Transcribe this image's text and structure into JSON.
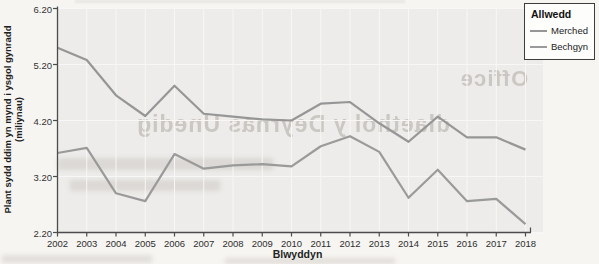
{
  "colors": {
    "page_bg": "#f6f5f2",
    "plot_bg": "#edecea",
    "gridline": "#f8f7f5",
    "axis": "#4c4c4c",
    "line_gray": "#969696",
    "legend_border": "#3d3d3d"
  },
  "chart": {
    "y_axis_label_line1": "Plant sydd ddim yn mynd i ysgol gynradd",
    "y_axis_label_line2": "(miliynau)",
    "x_axis_label": "Blwyddyn",
    "legend_title": "Allwedd"
  },
  "chart_data": {
    "type": "line",
    "title": "",
    "xlabel": "Blwyddyn",
    "ylabel": "Plant sydd ddim yn mynd i ysgol gynradd (miliynau)",
    "ylim": [
      2.2,
      6.2
    ],
    "yticks": [
      "6.20",
      "5.20",
      "4.20",
      "3.20",
      "2.20"
    ],
    "grid": true,
    "legend_position": "top-right",
    "categories": [
      "2002",
      "2003",
      "2004",
      "2005",
      "2006",
      "2007",
      "2008",
      "2009",
      "2010",
      "2011",
      "2012",
      "2013",
      "2014",
      "2015",
      "2016",
      "2017",
      "2018"
    ],
    "series": [
      {
        "name": "Merched",
        "color": "#969696",
        "values": [
          5.5,
          5.28,
          4.65,
          4.28,
          4.82,
          4.32,
          4.27,
          4.22,
          4.2,
          4.5,
          4.53,
          4.15,
          3.82,
          4.27,
          3.9,
          3.9,
          3.68
        ]
      },
      {
        "name": "Bechgyn",
        "color": "#9a9a9a",
        "values": [
          3.62,
          3.71,
          2.9,
          2.76,
          3.6,
          3.34,
          3.4,
          3.42,
          3.38,
          3.74,
          3.92,
          3.64,
          2.82,
          3.32,
          2.76,
          2.8,
          2.35
        ]
      }
    ]
  },
  "ghost_text": {
    "word": "Office",
    "headline": "dlaethol y Deyrnas Unedig"
  }
}
